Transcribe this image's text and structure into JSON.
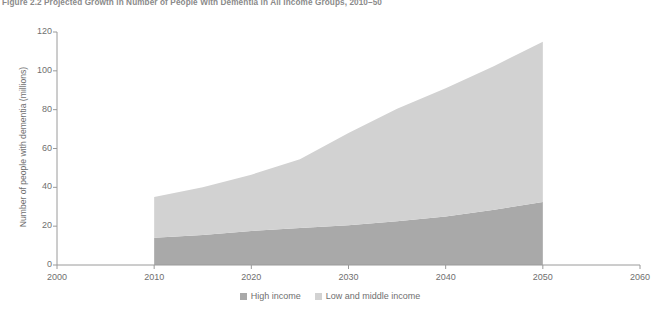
{
  "figure": {
    "title": "Figure 2.2  Projected Growth in Number of People With Dementia in All Income Groups, 2010–50"
  },
  "colors": {
    "high_income": "#a9a9a9",
    "low_middle_income": "#d2d2d2",
    "axis": "#9a9a9a",
    "text": "#6f6f6f",
    "background": "#ffffff"
  },
  "legend": {
    "position": "bottom-center",
    "items": [
      {
        "label": "High income",
        "color": "#a9a9a9",
        "swatch": "high-income-swatch"
      },
      {
        "label": "Low and middle income",
        "color": "#d2d2d2",
        "swatch": "low-middle-income-swatch"
      }
    ]
  },
  "chart_data": {
    "type": "area",
    "stacked": true,
    "title": "Figure 2.2  Projected Growth in Number of People With Dementia in All Income Groups, 2010–50",
    "xlabel": "",
    "ylabel": "Number of people with dementia (millions)",
    "xlim": [
      2000,
      2060
    ],
    "ylim": [
      0,
      120
    ],
    "xticks": [
      2000,
      2010,
      2020,
      2030,
      2040,
      2050,
      2060
    ],
    "yticks": [
      0,
      20,
      40,
      60,
      80,
      100,
      120
    ],
    "xtick_labels": [
      "2000",
      "2010",
      "2020",
      "2030",
      "2040",
      "2050",
      "2060"
    ],
    "ytick_labels": [
      "0",
      "20",
      "40",
      "60",
      "80",
      "100",
      "120"
    ],
    "grid": false,
    "data_x_range": [
      2010,
      2050
    ],
    "x": [
      2010,
      2015,
      2020,
      2025,
      2030,
      2035,
      2040,
      2045,
      2050
    ],
    "series": [
      {
        "name": "High income",
        "color": "#a9a9a9",
        "values": [
          14,
          15.5,
          17.5,
          19,
          20.5,
          22.5,
          25,
          28.5,
          32.5
        ]
      },
      {
        "name": "Low and middle income",
        "color": "#d2d2d2",
        "values": [
          21,
          24.5,
          29,
          35.5,
          47.5,
          58,
          66,
          74,
          82.5
        ]
      }
    ],
    "totals": [
      35,
      40,
      46.5,
      54.5,
      68,
      80.5,
      91,
      102.5,
      115
    ]
  }
}
